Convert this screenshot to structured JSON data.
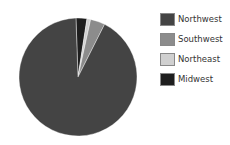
{
  "chart_data": {
    "type": "pie",
    "title": "",
    "categories": [
      "Northwest",
      "Southwest",
      "Northeast",
      "Midwest"
    ],
    "values": [
      92,
      4,
      1,
      3
    ],
    "colors": [
      "#444444",
      "#8c8c8c",
      "#d0d0d0",
      "#1e1e1e"
    ],
    "legend_position": "right",
    "draw_order_clockwise_from_top": [
      "Midwest",
      "Northeast",
      "Southwest",
      "Northwest"
    ]
  },
  "legend": {
    "items": [
      {
        "label": "Northwest",
        "color": "#444444"
      },
      {
        "label": "Southwest",
        "color": "#8c8c8c"
      },
      {
        "label": "Northeast",
        "color": "#d0d0d0"
      },
      {
        "label": "Midwest",
        "color": "#1e1e1e"
      }
    ]
  }
}
